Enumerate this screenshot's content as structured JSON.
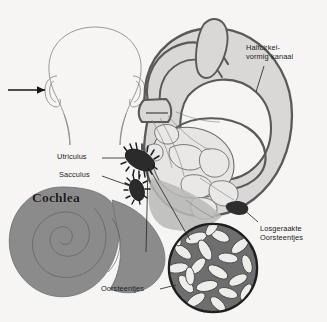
{
  "figure": {
    "background_color": "#f6f5f3",
    "ink_color": "#4e4e4e",
    "fill_light": "#d9d8d6",
    "fill_mid": "#8b8b8b",
    "fill_dark": "#3a3a3a"
  },
  "labels": {
    "semicircular_canal": "Halfcirkel-\nvormig kanaal",
    "utriculus": "Utriculus",
    "sacculus": "Sacculus",
    "cochlea": "Cochlea",
    "loose_otoliths": "Losgeraakte\nOorsteentjes",
    "otoliths": "Oorsteentjes"
  },
  "icons": {
    "head_outline": "head-outline",
    "pointer_arrow": "arrow-right",
    "inset_circle": "otolith-inset-circle"
  },
  "caption": ""
}
